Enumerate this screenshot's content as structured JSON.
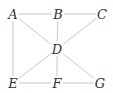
{
  "graph": {
    "nodes": [
      {
        "id": "A",
        "label": "A",
        "x": 13,
        "y": 14
      },
      {
        "id": "B",
        "label": "B",
        "x": 58,
        "y": 14
      },
      {
        "id": "C",
        "label": "C",
        "x": 102,
        "y": 14
      },
      {
        "id": "D",
        "label": "D",
        "x": 57,
        "y": 49
      },
      {
        "id": "E",
        "label": "E",
        "x": 13,
        "y": 83
      },
      {
        "id": "F",
        "label": "F",
        "x": 57,
        "y": 83
      },
      {
        "id": "G",
        "label": "G",
        "x": 100,
        "y": 83
      }
    ],
    "edges": [
      [
        "A",
        "B"
      ],
      [
        "B",
        "C"
      ],
      [
        "A",
        "E"
      ],
      [
        "A",
        "D"
      ],
      [
        "B",
        "D"
      ],
      [
        "C",
        "D"
      ],
      [
        "D",
        "E"
      ],
      [
        "D",
        "F"
      ],
      [
        "D",
        "G"
      ],
      [
        "E",
        "F"
      ],
      [
        "F",
        "G"
      ]
    ],
    "colors": {
      "edge": "#c8c8c8",
      "label": "#333333",
      "background": "#ffffff"
    }
  }
}
